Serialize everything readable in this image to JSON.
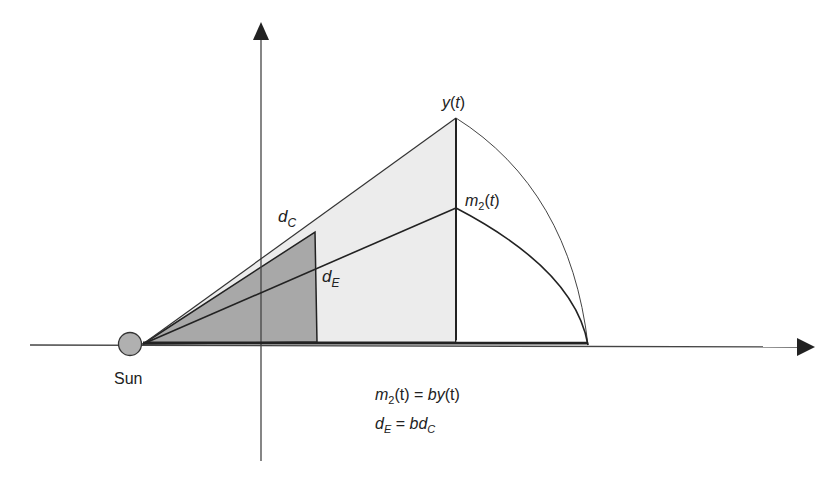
{
  "diagram": {
    "labels": {
      "sun": "Sun",
      "y_t": {
        "main": "y",
        "rest": "(",
        "var": "t",
        "close": ")"
      },
      "m2_t": {
        "main": "m",
        "sub": "2",
        "open": "(",
        "var": "t",
        "close": ")"
      },
      "d_c": {
        "main": "d",
        "sub": "C"
      },
      "d_e": {
        "main": "d",
        "sub": "E"
      }
    },
    "equations": {
      "eq1": {
        "lhs_main": "m",
        "lhs_sub": "2",
        "lhs_rest": "(t) = ",
        "rhs_b": "by",
        "rhs_rest": "(t)"
      },
      "eq2": {
        "lhs_main": "d",
        "lhs_sub": "E",
        "eq": " = ",
        "rhs_b": "bd",
        "rhs_sub": "C"
      }
    },
    "colors": {
      "line": "#222222",
      "light_fill": "#ececec",
      "dark_fill": "#a8a8a8",
      "sun_fill": "#b0b0b0"
    }
  }
}
